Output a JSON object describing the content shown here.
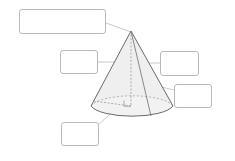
{
  "document": {
    "title": "Cone Labeling Worksheet",
    "background_color": "#ffffff"
  },
  "figure": {
    "name": "cone",
    "shape": "right circular cone",
    "fill_color": "#eeeeee",
    "outline_color": "#555555",
    "dashed_color": "#888888",
    "leader_color": "#9a9a9a",
    "parts": [
      {
        "name": "apex",
        "label": ""
      },
      {
        "name": "height-axis",
        "label": ""
      },
      {
        "name": "slant-height",
        "label": ""
      },
      {
        "name": "lateral-surface",
        "label": ""
      },
      {
        "name": "base-circle",
        "label": ""
      },
      {
        "name": "radius",
        "label": ""
      },
      {
        "name": "right-angle-marker",
        "label": ""
      }
    ]
  },
  "label_boxes": [
    {
      "id": "vertex",
      "text": "",
      "placeholder": ""
    },
    {
      "id": "height",
      "text": "",
      "placeholder": ""
    },
    {
      "id": "slant",
      "text": "",
      "placeholder": ""
    },
    {
      "id": "lateral",
      "text": "",
      "placeholder": ""
    },
    {
      "id": "base",
      "text": "",
      "placeholder": ""
    }
  ]
}
